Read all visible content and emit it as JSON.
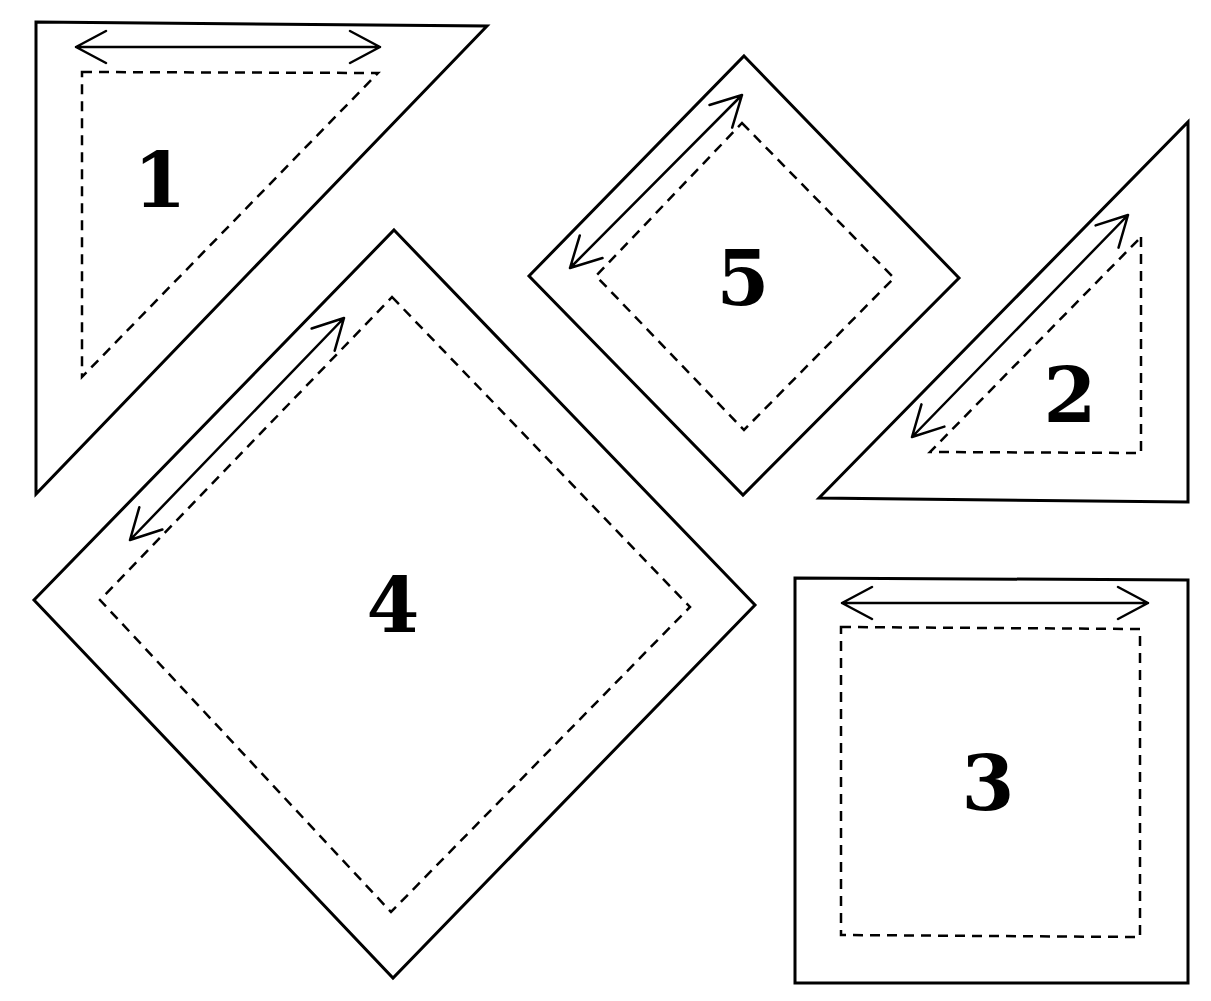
{
  "diagram": {
    "type": "quilt-template-pieces",
    "colors": {
      "line": "#000000",
      "background": "#ffffff"
    },
    "legend": {
      "solid_line": "cutting line",
      "dashed_line": "seam line",
      "double_arrow": "grain line"
    },
    "pieces": [
      {
        "id": 1,
        "label": "1",
        "shape": "right-triangle",
        "outer": [
          [
            36,
            22
          ],
          [
            487,
            26
          ],
          [
            36,
            494
          ]
        ],
        "seam": [
          [
            82,
            72
          ],
          [
            378,
            73
          ],
          [
            82,
            377
          ]
        ],
        "arrow": [
          [
            76,
            47
          ],
          [
            380,
            47
          ]
        ],
        "label_pos": [
          160,
          180
        ]
      },
      {
        "id": 2,
        "label": "2",
        "shape": "right-triangle",
        "outer": [
          [
            1188,
            122
          ],
          [
            1188,
            502
          ],
          [
            819,
            498
          ]
        ],
        "seam": [
          [
            1141,
            237
          ],
          [
            1141,
            453
          ],
          [
            930,
            452
          ]
        ],
        "arrow": [
          [
            912,
            437
          ],
          [
            1128,
            215
          ]
        ],
        "label_pos": [
          1070,
          395
        ]
      },
      {
        "id": 3,
        "label": "3",
        "shape": "square",
        "outer": [
          [
            795,
            578
          ],
          [
            1188,
            580
          ],
          [
            1188,
            983
          ],
          [
            795,
            983
          ]
        ],
        "seam": [
          [
            841,
            627
          ],
          [
            1140,
            629
          ],
          [
            1140,
            937
          ],
          [
            841,
            935
          ]
        ],
        "arrow": [
          [
            842,
            603
          ],
          [
            1148,
            603
          ]
        ],
        "label_pos": [
          988,
          783
        ]
      },
      {
        "id": 4,
        "label": "4",
        "shape": "square-on-point",
        "outer": [
          [
            394,
            230
          ],
          [
            755,
            605
          ],
          [
            393,
            978
          ],
          [
            34,
            600
          ]
        ],
        "seam": [
          [
            392,
            297
          ],
          [
            690,
            607
          ],
          [
            391,
            912
          ],
          [
            100,
            600
          ]
        ],
        "arrow": [
          [
            130,
            540
          ],
          [
            344,
            318
          ]
        ],
        "label_pos": [
          393,
          605
        ]
      },
      {
        "id": 5,
        "label": "5",
        "shape": "square-on-point",
        "outer": [
          [
            744,
            56
          ],
          [
            959,
            278
          ],
          [
            743,
            495
          ],
          [
            529,
            276
          ]
        ],
        "seam": [
          [
            742,
            123
          ],
          [
            894,
            278
          ],
          [
            744,
            430
          ],
          [
            596,
            276
          ]
        ],
        "arrow": [
          [
            570,
            268
          ],
          [
            742,
            95
          ]
        ],
        "label_pos": [
          743,
          278
        ]
      }
    ]
  }
}
